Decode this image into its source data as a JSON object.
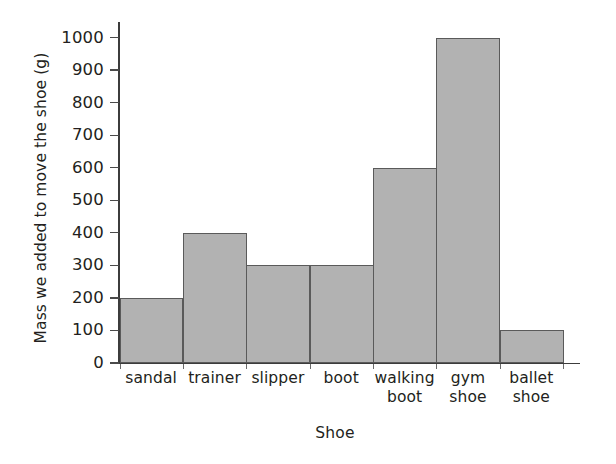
{
  "chart_data": {
    "type": "bar",
    "title": "",
    "xlabel": "Shoe",
    "ylabel": "Mass we added to move the shoe (g)",
    "categories": [
      "sandal",
      "trainer",
      "slipper",
      "boot",
      "walking\nboot",
      "gym\nshoe",
      "ballet\nshoe"
    ],
    "values": [
      200,
      400,
      300,
      300,
      600,
      1000,
      100
    ],
    "ylim": [
      0,
      1000
    ],
    "yticks": [
      0,
      100,
      200,
      300,
      400,
      500,
      600,
      700,
      800,
      900,
      1000
    ],
    "ytick_labels": [
      "0",
      "100",
      "200",
      "300",
      "400",
      "500",
      "600",
      "700",
      "800",
      "900",
      "1000"
    ],
    "grid": false,
    "legend": null,
    "bar_fill_color": "#b2b2b2",
    "bar_edge_color": "#5a5a5a",
    "axis_color": "#3c3c3c",
    "background_color": "#ffffff"
  }
}
